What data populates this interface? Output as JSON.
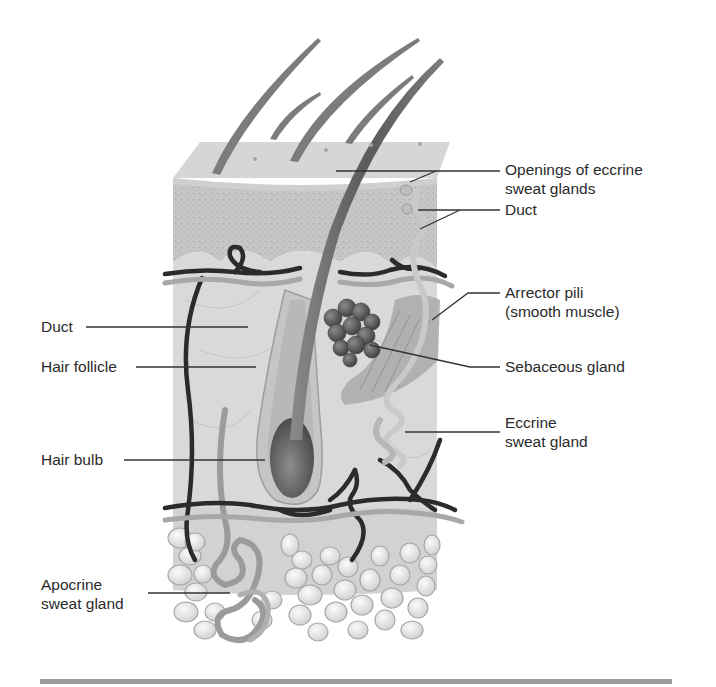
{
  "figure": {
    "colors": {
      "background": "#ffffff",
      "epidermis": "#c9c9c9",
      "dermis": "#dcdcdc",
      "hypodermis_fat": "#efefef",
      "hair": "#6f6f6f",
      "vessels_dark": "#2b2b2b",
      "vessels_light": "#a8a8a8",
      "sebaceous": "#5e5e5e",
      "leader_line": "#333333",
      "text": "#2a2a2a",
      "rule": "#9a9a9a"
    }
  },
  "labels": {
    "right": [
      {
        "id": "openings",
        "lines": [
          "Openings of eccrine",
          "sweat glands"
        ]
      },
      {
        "id": "duct_right",
        "lines": [
          "Duct"
        ]
      },
      {
        "id": "arrector",
        "lines": [
          "Arrector pili",
          "(smooth muscle)"
        ]
      },
      {
        "id": "sebaceous",
        "lines": [
          "Sebaceous gland"
        ]
      },
      {
        "id": "eccrine",
        "lines": [
          "Eccrine",
          "sweat gland"
        ]
      }
    ],
    "left": [
      {
        "id": "duct_left",
        "lines": [
          "Duct"
        ]
      },
      {
        "id": "follicle",
        "lines": [
          "Hair follicle"
        ]
      },
      {
        "id": "bulb",
        "lines": [
          "Hair bulb"
        ]
      },
      {
        "id": "apocrine",
        "lines": [
          "Apocrine",
          "sweat gland"
        ]
      }
    ]
  }
}
